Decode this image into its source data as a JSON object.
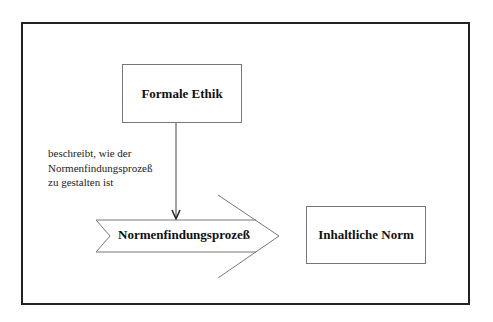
{
  "diagram": {
    "nodes": {
      "formal_ethics": "Formale Ethik",
      "process": "Normenfindungsprozeß",
      "content_norm": "Inhaltliche Norm"
    },
    "edge_label": {
      "line1": "beschreibt, wie der",
      "line2": "Normenfindungsprozeß",
      "line3": "zu gestalten ist"
    }
  }
}
